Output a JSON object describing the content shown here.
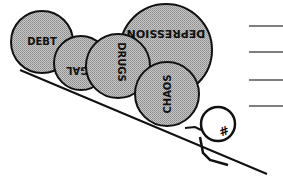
{
  "illustration": {
    "description": "Cartoon of a small figure pushing uphill against a pile of large boulders on a slope",
    "colors": {
      "ink": "#111111",
      "boulder_fill": "#bdbdbd",
      "background": "#ffffff",
      "lines": "#555555"
    },
    "boulders": [
      {
        "label": "DEBT",
        "cx": 42,
        "cy": 42,
        "r": 31,
        "rotate": 0
      },
      {
        "label": "LEGAL",
        "cx": 81,
        "cy": 63,
        "r": 27,
        "rotate": 180
      },
      {
        "label": "DRUGS",
        "cx": 118,
        "cy": 66,
        "r": 32,
        "rotate": 90
      },
      {
        "label": "DEPRESSION",
        "cx": 166,
        "cy": 50,
        "r": 46,
        "rotate": 180
      },
      {
        "label": "CHAOS",
        "cx": 167,
        "cy": 94,
        "r": 32,
        "rotate": -90
      }
    ],
    "figure": {
      "head_symbol": "#",
      "head_cx": 218,
      "head_cy": 124,
      "head_r": 17
    },
    "right_lines_count": 4
  }
}
